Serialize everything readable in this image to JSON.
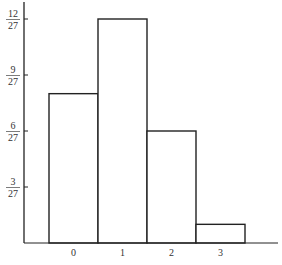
{
  "chart_data": {
    "type": "bar",
    "title": "",
    "xlabel": "",
    "ylabel": "",
    "categories": [
      "0",
      "1",
      "2",
      "3"
    ],
    "values": [
      8,
      12,
      6,
      1
    ],
    "value_denominator": 27,
    "values_fraction": [
      "8/27",
      "12/27",
      "6/27",
      "1/27"
    ],
    "ylim": [
      0,
      12.5
    ],
    "yticks": [
      {
        "num": "3",
        "den": "27",
        "value": 3
      },
      {
        "num": "6",
        "den": "27",
        "value": 6
      },
      {
        "num": "9",
        "den": "27",
        "value": 9
      },
      {
        "num": "12",
        "den": "27",
        "value": 12
      }
    ],
    "grid": false,
    "legend": "none",
    "colors": {
      "bar_fill": "#ffffff",
      "bar_stroke": "#222222",
      "axis": "#222222"
    }
  }
}
